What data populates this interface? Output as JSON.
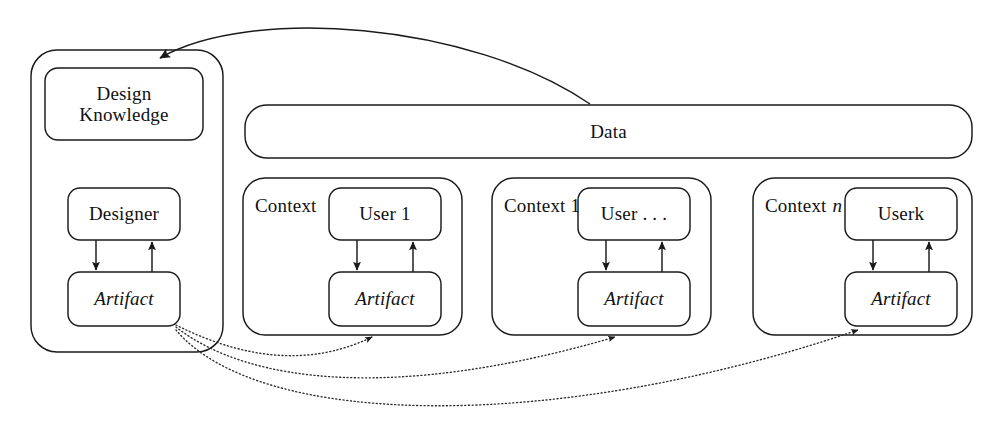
{
  "figure": {
    "kind": "block-diagram",
    "background_color": "#ffffff",
    "stroke_color": "#1a1a1a",
    "width": 1002,
    "height": 432
  },
  "designer_panel": {
    "name": "designer-panel",
    "design_knowledge": {
      "label": "Design\nKnowledge"
    },
    "designer": {
      "label": "Designer"
    },
    "artifact": {
      "label": "Artifact",
      "italic": true
    }
  },
  "data_bar": {
    "label": "Data"
  },
  "contexts": [
    {
      "context_label": "Context",
      "context_label_suffix": "",
      "user": {
        "label": "User 1"
      },
      "artifact": {
        "label": "Artifact",
        "italic": true
      }
    },
    {
      "context_label": "Context 1",
      "context_label_suffix": "",
      "user": {
        "label": "User . . ."
      },
      "artifact": {
        "label": "Artifact",
        "italic": true
      }
    },
    {
      "context_label": "Context",
      "context_label_suffix": "n",
      "user_prefix": "User ",
      "user_suffix": "k",
      "user": {
        "label": "User k"
      },
      "artifact": {
        "label": "Artifact",
        "italic": true
      }
    }
  ],
  "connectors": {
    "designer_down": "Designer to Artifact (solid, downward)",
    "designer_up": "Artifact to Designer (solid, upward)",
    "user_down": "User to Artifact (solid, downward)",
    "user_up": "Artifact to User (solid, upward)",
    "data_feedback": "Data to Design Knowledge (solid curve, arrowhead at Design Knowledge)",
    "artifact_deploy": "Designer Artifact to each Context Artifact (dotted curves, arrowheads at Context Artifacts)"
  }
}
